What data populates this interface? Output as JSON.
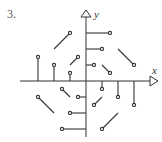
{
  "problem_number": "3.",
  "axes": {
    "x_label": "x",
    "y_label": "y"
  },
  "field": "F(x,y) = (y, -x)",
  "colors": {
    "ink": "#333333"
  },
  "vectors": [
    {
      "x": 1,
      "y": 0
    },
    {
      "x": 2,
      "y": 0
    },
    {
      "x": 3,
      "y": 0
    },
    {
      "x": -1,
      "y": 0
    },
    {
      "x": -2,
      "y": 0
    },
    {
      "x": -3,
      "y": 0
    },
    {
      "x": 0,
      "y": 1
    },
    {
      "x": 0,
      "y": 2
    },
    {
      "x": 0,
      "y": 3
    },
    {
      "x": 0,
      "y": -1
    },
    {
      "x": 0,
      "y": -2
    },
    {
      "x": 0,
      "y": -3
    },
    {
      "x": 1,
      "y": 1
    },
    {
      "x": 2,
      "y": 2
    },
    {
      "x": -1,
      "y": 1
    },
    {
      "x": -2,
      "y": 2
    },
    {
      "x": -1,
      "y": -1
    },
    {
      "x": -2,
      "y": -2
    },
    {
      "x": 1,
      "y": -1
    },
    {
      "x": 2,
      "y": -2
    }
  ]
}
